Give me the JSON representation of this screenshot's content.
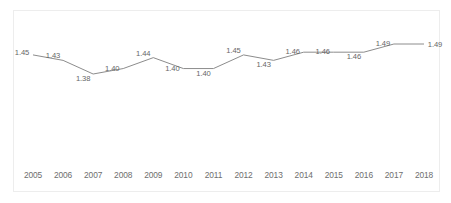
{
  "chart_data": {
    "type": "line",
    "title": "",
    "subtitle": "",
    "xlabel": "",
    "ylabel": "",
    "categories": [
      "2005",
      "2006",
      "2007",
      "2008",
      "2009",
      "2010",
      "2011",
      "2012",
      "2013",
      "2014",
      "2015",
      "2016",
      "2017",
      "2018"
    ],
    "values": [
      1.45,
      1.43,
      1.38,
      1.4,
      1.44,
      1.4,
      1.4,
      1.45,
      1.43,
      1.46,
      1.46,
      1.46,
      1.49,
      1.49
    ],
    "data_labels": [
      "1.45",
      "1.43",
      "1.38",
      "1.40",
      "1.44",
      "1.40",
      "1.40",
      "1.45",
      "1.43",
      "1.46",
      "1.46",
      "1.46",
      "1.49",
      "1.49"
    ],
    "series": [
      {
        "name": "",
        "values": [
          1.45,
          1.43,
          1.38,
          1.4,
          1.44,
          1.4,
          1.4,
          1.45,
          1.43,
          1.46,
          1.46,
          1.46,
          1.49,
          1.49
        ]
      }
    ],
    "ylim": [
      1.36,
      1.51
    ],
    "grid": false,
    "legend": false,
    "legend_position": "none",
    "line_color": "#8c8c8c",
    "label_color": "#666666",
    "axis_label_color": "#6e6e6e",
    "plot_background": "#ffffff",
    "plot_border_color": "#ededed"
  }
}
